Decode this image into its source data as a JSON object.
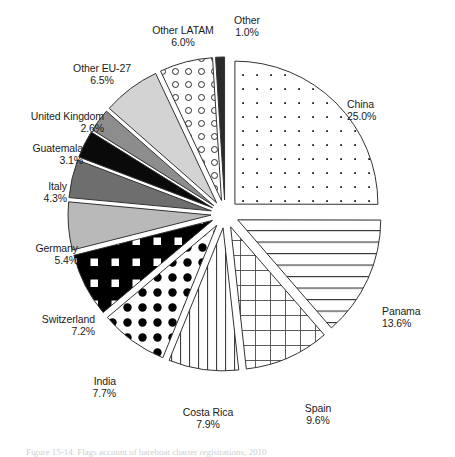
{
  "figure": {
    "caption": "Figure 15-14. Flags account of bareboat charter registrations, 2010"
  },
  "chart_data": {
    "type": "pie",
    "title": "",
    "exploded": true,
    "start_angle_deg": -90,
    "direction": "clockwise",
    "legend_position": "outside-labels",
    "categories": [
      "China",
      "Panama",
      "Spain",
      "Costa Rica",
      "India",
      "Switzerland",
      "Germany",
      "Italy",
      "Guatemala",
      "United Kingdom",
      "Other EU-27",
      "Other LATAM",
      "Other"
    ],
    "values": [
      25.0,
      13.6,
      9.6,
      7.9,
      7.7,
      7.2,
      5.4,
      4.3,
      3.1,
      2.6,
      6.5,
      6.0,
      1.0
    ],
    "value_labels": [
      "25.0%",
      "13.6%",
      "9.6%",
      "7.9%",
      "7.7%",
      "7.2%",
      "5.4%",
      "4.3%",
      "3.1%",
      "2.6%",
      "6.5%",
      "6.0%",
      "1.0%"
    ],
    "unit": "%",
    "slices": [
      {
        "label": "China",
        "value": 25.0,
        "value_label": "25.0%",
        "fill": "dots-fine",
        "base_color": "#ffffff"
      },
      {
        "label": "Panama",
        "value": 13.6,
        "value_label": "13.6%",
        "fill": "horizontal",
        "base_color": "#ffffff"
      },
      {
        "label": "Spain",
        "value": 9.6,
        "value_label": "9.6%",
        "fill": "grid",
        "base_color": "#ffffff"
      },
      {
        "label": "Costa Rica",
        "value": 7.9,
        "value_label": "7.9%",
        "fill": "vertical",
        "base_color": "#ffffff"
      },
      {
        "label": "India",
        "value": 7.7,
        "value_label": "7.7%",
        "fill": "big-dots",
        "base_color": "#ffffff"
      },
      {
        "label": "Switzerland",
        "value": 7.2,
        "value_label": "7.2%",
        "fill": "white-squares",
        "base_color": "#000000"
      },
      {
        "label": "Germany",
        "value": 5.4,
        "value_label": "5.4%",
        "fill": "solid",
        "base_color": "#b9b9b9"
      },
      {
        "label": "Italy",
        "value": 4.3,
        "value_label": "4.3%",
        "fill": "solid",
        "base_color": "#6e6e6e"
      },
      {
        "label": "Guatemala",
        "value": 3.1,
        "value_label": "3.1%",
        "fill": "solid",
        "base_color": "#0a0a0a"
      },
      {
        "label": "United Kingdom",
        "value": 2.6,
        "value_label": "2.6%",
        "fill": "solid",
        "base_color": "#8d8d8d"
      },
      {
        "label": "Other EU-27",
        "value": 6.5,
        "value_label": "6.5%",
        "fill": "solid",
        "base_color": "#d3d3d3"
      },
      {
        "label": "Other LATAM",
        "value": 6.0,
        "value_label": "6.0%",
        "fill": "circles",
        "base_color": "#ffffff"
      },
      {
        "label": "Other",
        "value": 1.0,
        "value_label": "1.0%",
        "fill": "solid",
        "base_color": "#2b2b2b"
      }
    ]
  },
  "colors": {
    "outline": "#333333",
    "text": "#1b1b1b",
    "background": "#ffffff"
  }
}
